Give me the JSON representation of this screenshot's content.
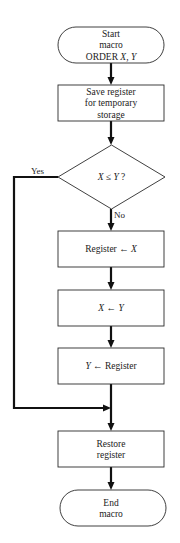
{
  "diagram": {
    "type": "flowchart",
    "nodes": [
      {
        "id": "start",
        "kind": "terminator",
        "lines": [
          [
            {
              "t": "Start"
            }
          ],
          [
            {
              "t": "macro"
            }
          ],
          [
            {
              "t": "ORDER "
            },
            {
              "t": "X",
              "i": true
            },
            {
              "t": ", "
            },
            {
              "t": "Y",
              "i": true
            }
          ]
        ]
      },
      {
        "id": "save",
        "kind": "process",
        "lines": [
          [
            {
              "t": "Save register"
            }
          ],
          [
            {
              "t": "for temporary"
            }
          ],
          [
            {
              "t": "storage"
            }
          ]
        ]
      },
      {
        "id": "compare",
        "kind": "decision",
        "lines": [
          [
            {
              "t": "X",
              "i": true
            },
            {
              "t": " ≤ "
            },
            {
              "t": "Y",
              "i": true
            },
            {
              "t": " ?"
            }
          ]
        ]
      },
      {
        "id": "reg-x",
        "kind": "process",
        "lines": [
          [
            {
              "t": "Register ← "
            },
            {
              "t": "X",
              "i": true
            }
          ]
        ]
      },
      {
        "id": "x-y",
        "kind": "process",
        "lines": [
          [
            {
              "t": "X",
              "i": true
            },
            {
              "t": " ← "
            },
            {
              "t": "Y",
              "i": true
            }
          ]
        ]
      },
      {
        "id": "y-reg",
        "kind": "process",
        "lines": [
          [
            {
              "t": "Y",
              "i": true
            },
            {
              "t": " ← Register"
            }
          ]
        ]
      },
      {
        "id": "restore",
        "kind": "process",
        "lines": [
          [
            {
              "t": "Restore"
            }
          ],
          [
            {
              "t": "register"
            }
          ]
        ]
      },
      {
        "id": "end",
        "kind": "terminator",
        "lines": [
          [
            {
              "t": "End"
            }
          ],
          [
            {
              "t": "macro"
            }
          ]
        ]
      }
    ],
    "edges": [
      {
        "from": "start",
        "to": "save",
        "label": ""
      },
      {
        "from": "save",
        "to": "compare",
        "label": ""
      },
      {
        "from": "compare",
        "to": "reg-x",
        "label": "No"
      },
      {
        "from": "reg-x",
        "to": "x-y",
        "label": ""
      },
      {
        "from": "x-y",
        "to": "y-reg",
        "label": ""
      },
      {
        "from": "y-reg",
        "to": "restore",
        "label": ""
      },
      {
        "from": "compare",
        "to": "restore",
        "label": "Yes"
      },
      {
        "from": "restore",
        "to": "end",
        "label": ""
      }
    ]
  }
}
